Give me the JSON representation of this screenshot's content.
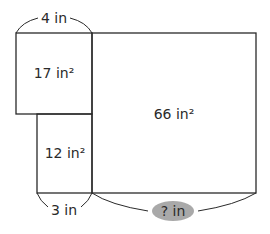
{
  "diagram": {
    "top_width_label": "4 in",
    "bottom_width_label": "3 in",
    "unknown_width_label": "? in",
    "regions": [
      {
        "id": "top-left",
        "area_label": "17 in²"
      },
      {
        "id": "bottom-left",
        "area_label": "12 in²"
      },
      {
        "id": "right",
        "area_label": "66 in²"
      }
    ],
    "colors": {
      "stroke": "#2a2a2a",
      "unknown_badge": "#a9a9a9"
    }
  }
}
